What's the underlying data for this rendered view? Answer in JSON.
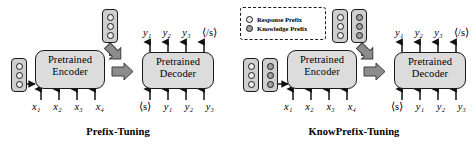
{
  "figure": {
    "panels": [
      {
        "id": "prefix-tuning",
        "caption": "Prefix-Tuning",
        "encoder": {
          "line1": "Pretrained",
          "line2": "Encoder",
          "direction": "bidirectional"
        },
        "decoder": {
          "line1": "Pretrained",
          "line2": "Decoder",
          "direction": "unidirectional"
        },
        "encoder_inputs": [
          "x1",
          "x2",
          "x3",
          "x4"
        ],
        "decoder_inputs": [
          "<s>",
          "y1",
          "y2",
          "y3"
        ],
        "decoder_outputs": [
          "y1",
          "y2",
          "y3",
          "</s>"
        ],
        "encoder_prefix_stacks": [
          {
            "type": "response",
            "count": 3
          }
        ],
        "decoder_prefix_stacks": [
          {
            "type": "response",
            "count": 3
          }
        ]
      },
      {
        "id": "knowprefix-tuning",
        "caption": "KnowPrefix-Tuning",
        "encoder": {
          "line1": "Pretrained",
          "line2": "Encoder",
          "direction": "bidirectional"
        },
        "decoder": {
          "line1": "Pretrained",
          "line2": "Decoder",
          "direction": "unidirectional"
        },
        "encoder_inputs": [
          "x1",
          "x2",
          "x3",
          "x4"
        ],
        "decoder_inputs": [
          "<s>",
          "y1",
          "y2",
          "y3"
        ],
        "decoder_outputs": [
          "y1",
          "y2",
          "y3",
          "</s>"
        ],
        "encoder_prefix_stacks": [
          {
            "type": "response",
            "count": 3
          },
          {
            "type": "knowledge",
            "count": 3
          }
        ],
        "decoder_prefix_stacks": [
          {
            "type": "response",
            "count": 3
          },
          {
            "type": "knowledge",
            "count": 3
          }
        ]
      }
    ],
    "legend": {
      "items": [
        {
          "type": "response",
          "label": "Response Prefix"
        },
        {
          "type": "knowledge",
          "label": "Knowledge Prefix"
        }
      ]
    },
    "tokens": {
      "x1": "x₁",
      "x2": "x₂",
      "x3": "x₃",
      "x4": "x₄",
      "y1": "y₁",
      "y2": "y₂",
      "y3": "y₃",
      "<s>": "⟨s⟩",
      "</s>": "⟨/s⟩"
    },
    "colors": {
      "module_fill": "#dcdcdc",
      "stack_fill": "#cfcfcf",
      "response_dot": "#ededed",
      "knowledge_dot": "#a2a2a2",
      "block_arrow": "#8c8c8c",
      "outline": "#1a1a1a",
      "background": "#ffffff"
    }
  }
}
